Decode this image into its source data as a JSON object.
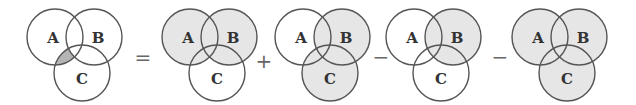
{
  "colors": {
    "stroke": "#555555",
    "light_shade": "#e6e6e6",
    "dark_shade": "#b5b5b5",
    "label": "#333333",
    "operator": "#666666"
  },
  "labels": {
    "a": "A",
    "b": "B",
    "c": "C"
  },
  "operators": [
    "=",
    "+",
    "−",
    "−"
  ],
  "diagrams": [
    {
      "name": "lhs",
      "shaded_region": "A ∩ C − B",
      "cx": 0
    },
    {
      "name": "term-1",
      "shaded_region": "A ∪ B",
      "cx": 0
    },
    {
      "name": "term-2",
      "shaded_region": "B ∪ C",
      "cx": 0
    },
    {
      "name": "term-3",
      "shaded_region": "B",
      "cx": 0
    },
    {
      "name": "term-4",
      "shaded_region": "A ∪ B ∪ C",
      "cx": 0
    }
  ]
}
